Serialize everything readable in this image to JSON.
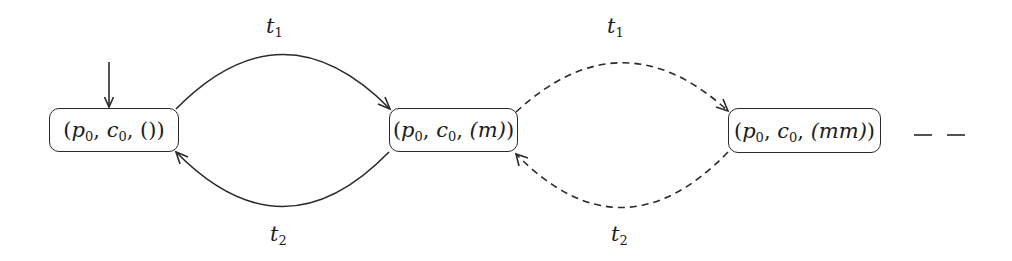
{
  "diagram": {
    "type": "state-transition-graph",
    "initial_state": "s0",
    "states": [
      {
        "id": "s0",
        "place": "p",
        "place_sub": "0",
        "counter": "c",
        "counter_sub": "0",
        "queue": "()"
      },
      {
        "id": "s1",
        "place": "p",
        "place_sub": "0",
        "counter": "c",
        "counter_sub": "0",
        "queue": "(m)"
      },
      {
        "id": "s2",
        "place": "p",
        "place_sub": "0",
        "counter": "c",
        "counter_sub": "0",
        "queue": "(mm)"
      }
    ],
    "transitions": [
      {
        "id": "e0",
        "from": "s0",
        "to": "s1",
        "label": "t",
        "label_sub": "1",
        "style": "solid"
      },
      {
        "id": "e1",
        "from": "s1",
        "to": "s0",
        "label": "t",
        "label_sub": "2",
        "style": "solid"
      },
      {
        "id": "e2",
        "from": "s1",
        "to": "s2",
        "label": "t",
        "label_sub": "1",
        "style": "dashed"
      },
      {
        "id": "e3",
        "from": "s2",
        "to": "s1",
        "label": "t",
        "label_sub": "2",
        "style": "dashed"
      }
    ],
    "continuation": "– –"
  }
}
